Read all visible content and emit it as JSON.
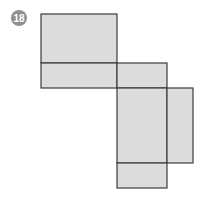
{
  "problem_number": "18",
  "figure": {
    "face_color": "#dcdcdc",
    "edge_color": "#3c3c3c",
    "badge_color": "#8f8f8f",
    "faces": [
      "top-left-large",
      "top-left-strip",
      "middle-small",
      "center-large",
      "right-flap",
      "bottom-small"
    ]
  }
}
